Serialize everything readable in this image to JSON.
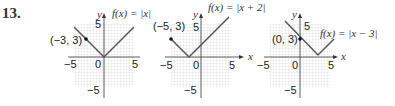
{
  "problem_number": "13.",
  "graphs": [
    {
      "function_label": "f(x) = |x|",
      "point_label": "(−3, 3)",
      "point": [
        -3,
        3
      ],
      "vertex": [
        0,
        0
      ],
      "axis_x_label": "x",
      "axis_y_label": "y",
      "ticks": {
        "x_neg": "−5",
        "origin": "0",
        "x_pos": "5",
        "y_pos": "5",
        "y_neg": "−5"
      }
    },
    {
      "function_label": "f(x) = |x + 2|",
      "point_label": "(−5, 3)",
      "point": [
        -5,
        3
      ],
      "vertex": [
        -2,
        0
      ],
      "axis_x_label": "x",
      "axis_y_label": "y",
      "ticks": {
        "x_neg": "−5",
        "origin": "0",
        "x_pos": "5",
        "y_pos": "5",
        "y_neg": "−5"
      }
    },
    {
      "function_label": "f(x) = |x − 3|",
      "point_label": "(0, 3)",
      "point": [
        0,
        3
      ],
      "vertex": [
        3,
        0
      ],
      "axis_x_label": "x",
      "axis_y_label": "y",
      "ticks": {
        "x_neg": "−5",
        "origin": "0",
        "x_pos": "5",
        "y_pos": "5",
        "y_neg": "−5"
      }
    }
  ],
  "colors": {
    "grid": "#c8c8c8",
    "axis": "#333333",
    "curve": "#555555",
    "point": "#111111"
  }
}
